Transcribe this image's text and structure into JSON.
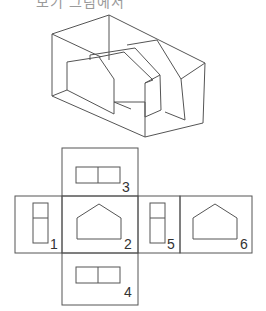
{
  "title_fragment": "보기 그림에서",
  "isometric": {
    "name": "isometric-object",
    "description": "Isometric view of a hollow box containing a pentagon-profiled block"
  },
  "views": [
    {
      "id": "view-3",
      "label": "3",
      "shape": "two-cell-horizontal-rect"
    },
    {
      "id": "view-1",
      "label": "1",
      "shape": "two-cell-vertical-rect"
    },
    {
      "id": "view-2",
      "label": "2",
      "shape": "pentagon"
    },
    {
      "id": "view-5",
      "label": "5",
      "shape": "two-cell-vertical-rect"
    },
    {
      "id": "view-6",
      "label": "6",
      "shape": "pentagon"
    },
    {
      "id": "view-4",
      "label": "4",
      "shape": "two-cell-horizontal-rect"
    }
  ],
  "colors": {
    "line": "#555555",
    "label": "#333333",
    "background": "#ffffff"
  }
}
